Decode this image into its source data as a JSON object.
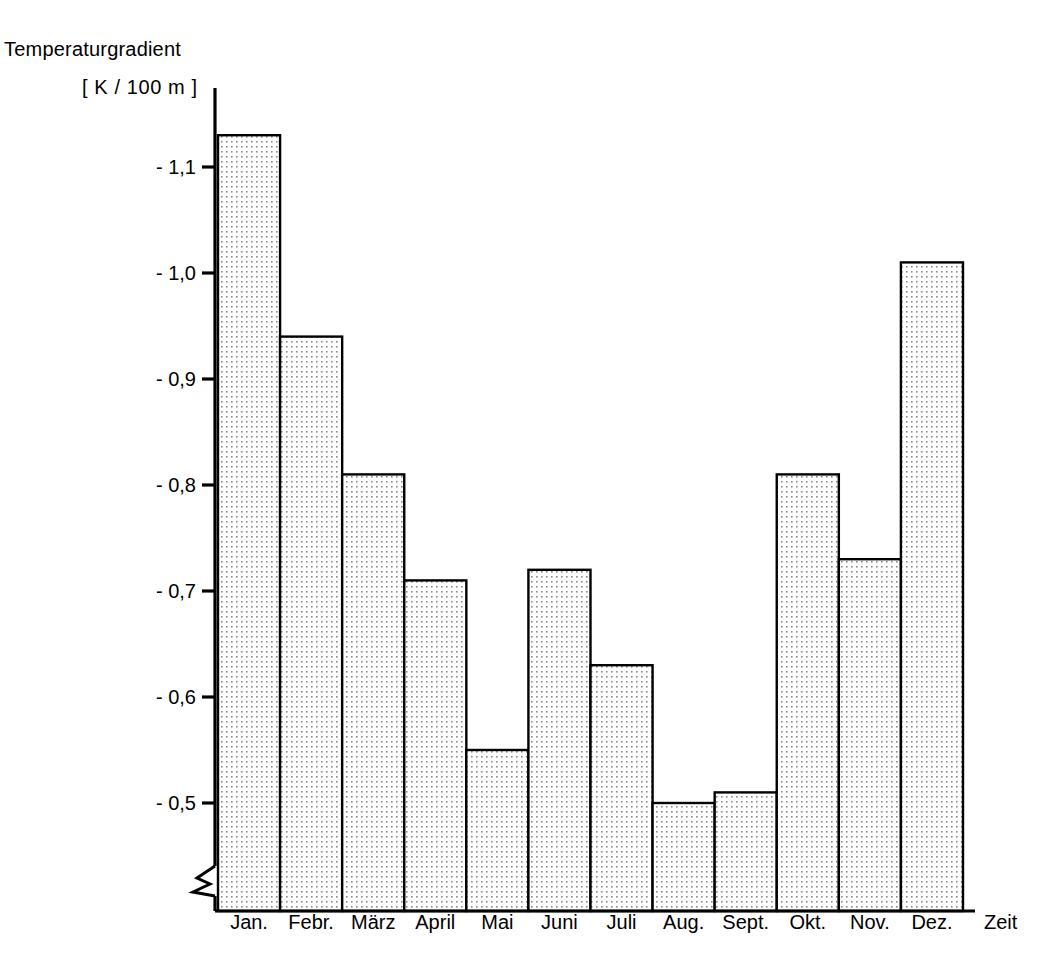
{
  "chart_data": {
    "type": "bar",
    "title": "",
    "ylabel": "Temperaturgradient",
    "yunit": "[ K / 100 m ]",
    "xlabel": "Zeit",
    "categories": [
      "Jan.",
      "Febr.",
      "März",
      "April",
      "Mai",
      "Juni",
      "Juli",
      "Aug.",
      "Sept.",
      "Okt.",
      "Nov.",
      "Dez."
    ],
    "values": [
      -1.13,
      -0.94,
      -0.81,
      -0.71,
      -0.55,
      -0.72,
      -0.63,
      -0.5,
      -0.51,
      -0.81,
      -0.73,
      -1.01
    ],
    "ytick_labels": [
      "- 1,1",
      "- 1,0",
      "- 0,9",
      "- 0,8",
      "- 0,7",
      "- 0,6",
      "- 0,5"
    ],
    "ytick_values": [
      -1.1,
      -1.0,
      -0.9,
      -0.8,
      -0.7,
      -0.6,
      -0.5
    ],
    "ylim": [
      -0.398,
      -1.17
    ],
    "axis_break": true,
    "grid": false,
    "legend": "none",
    "bar_fill": "dotted-pattern",
    "bar_edge_color": "#000000",
    "axis_color": "#000000"
  },
  "plot": {
    "left": 218,
    "right": 963,
    "baseline_y": 911,
    "axis_x": 215,
    "tick_top_y": 167,
    "tick_spacing_px": 106
  }
}
